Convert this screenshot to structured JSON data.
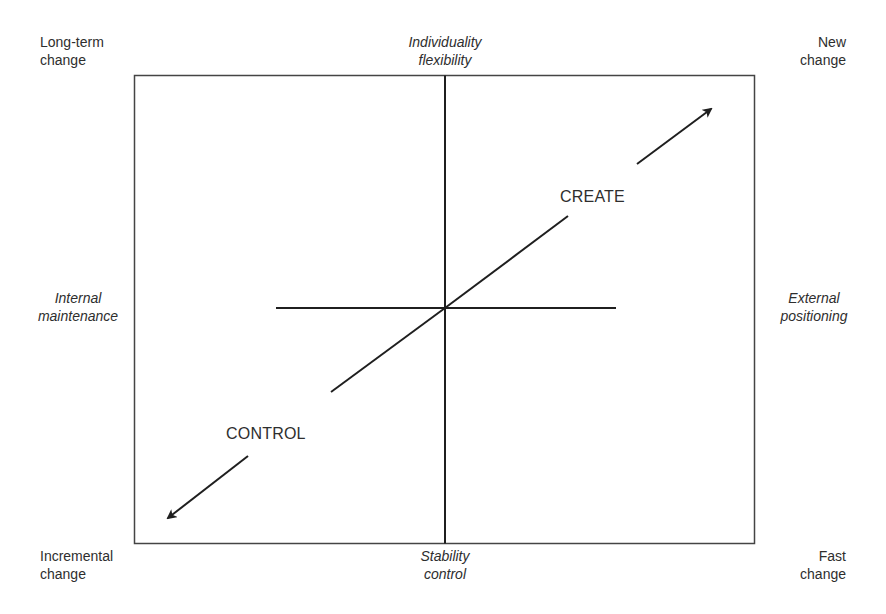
{
  "diagram": {
    "corners": {
      "top_left": [
        "Long-term",
        "change"
      ],
      "top_right": [
        "New",
        "change"
      ],
      "bottom_left": [
        "Incremental",
        "change"
      ],
      "bottom_right": [
        "Fast",
        "change"
      ]
    },
    "axes": {
      "top": [
        "Individuality",
        "flexibility"
      ],
      "bottom": [
        "Stability",
        "control"
      ],
      "left": [
        "Internal",
        "maintenance"
      ],
      "right": [
        "External",
        "positioning"
      ]
    },
    "arrows": {
      "up_right_label": "CREATE",
      "down_left_label": "CONTROL"
    },
    "colors": {
      "line": "#1f1f1f",
      "frame": "#444444",
      "text": "#2e2e2e"
    }
  }
}
